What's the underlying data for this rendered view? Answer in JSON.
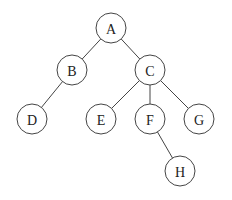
{
  "diagram": {
    "type": "tree",
    "nodes": [
      {
        "id": "A",
        "label": "A",
        "x": 111,
        "y": 28
      },
      {
        "id": "B",
        "label": "B",
        "x": 72,
        "y": 70
      },
      {
        "id": "C",
        "label": "C",
        "x": 150,
        "y": 70
      },
      {
        "id": "D",
        "label": "D",
        "x": 32,
        "y": 119
      },
      {
        "id": "E",
        "label": "E",
        "x": 101,
        "y": 119
      },
      {
        "id": "F",
        "label": "F",
        "x": 150,
        "y": 119
      },
      {
        "id": "G",
        "label": "G",
        "x": 199,
        "y": 119
      },
      {
        "id": "H",
        "label": "H",
        "x": 180,
        "y": 171
      }
    ],
    "edges": [
      {
        "from": "A",
        "to": "B"
      },
      {
        "from": "A",
        "to": "C"
      },
      {
        "from": "B",
        "to": "D"
      },
      {
        "from": "C",
        "to": "E"
      },
      {
        "from": "C",
        "to": "F"
      },
      {
        "from": "C",
        "to": "G"
      },
      {
        "from": "F",
        "to": "H"
      }
    ],
    "node_radius": 15
  }
}
